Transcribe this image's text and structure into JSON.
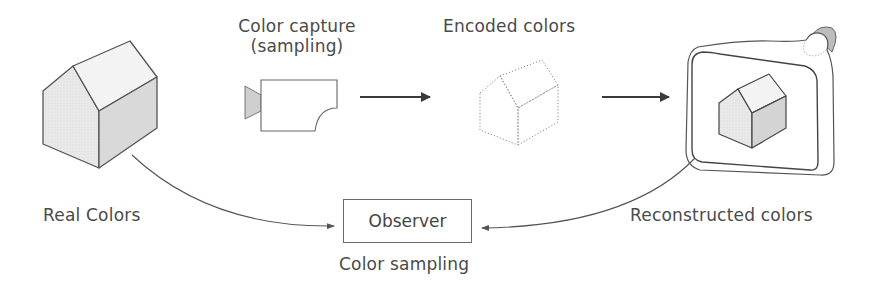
{
  "diagram": {
    "nodes": {
      "real_colors": {
        "label": "Real Colors",
        "icon": "solid-house-icon"
      },
      "color_capture": {
        "label_line1": "Color capture",
        "label_line2": "(sampling)",
        "icon": "video-camera-icon"
      },
      "encoded_colors": {
        "label": "Encoded colors",
        "icon": "dotted-house-icon"
      },
      "reconstructed_colors": {
        "label": "Reconstructed colors",
        "icon": "tv-screen-icon"
      },
      "observer": {
        "label": "Observer",
        "caption": "Color sampling"
      }
    },
    "edges": [
      {
        "from": "color_capture",
        "to": "encoded_colors",
        "style": "straight-arrow"
      },
      {
        "from": "encoded_colors",
        "to": "reconstructed_colors",
        "style": "straight-arrow"
      },
      {
        "from": "real_colors",
        "to": "observer",
        "style": "curved-arrow"
      },
      {
        "from": "reconstructed_colors",
        "to": "observer",
        "style": "curved-arrow"
      }
    ],
    "colors": {
      "stroke": "#555555",
      "text": "#4a4a4a",
      "face_light": "#f2f2f2",
      "face_mid": "#e4e4e4",
      "face_dark": "#d4d4d4",
      "lens_fill": "#cfcfcf"
    }
  }
}
